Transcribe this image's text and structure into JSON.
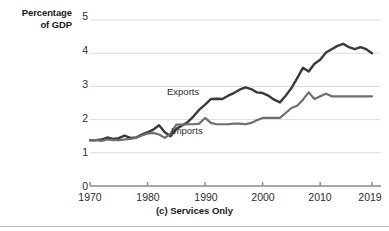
{
  "figure": {
    "caption": "(c) Services Only",
    "y_axis_title_line1": "Percentage",
    "y_axis_title_line2": "of GDP"
  },
  "colors": {
    "exports_line": "#3a3a3a",
    "imports_line": "#6e6e6e",
    "gridline": "#dcdcdc",
    "axis": "#8a8a8a",
    "text": "#2b2b2b"
  },
  "chart_data": {
    "type": "line",
    "title": "(c) Services Only",
    "xlabel": "",
    "ylabel": "Percentage of GDP",
    "xlim": [
      1970,
      2019
    ],
    "ylim": [
      0,
      5
    ],
    "yticks": [
      0,
      1,
      2,
      3,
      4,
      5
    ],
    "ytick_labels": [
      "0",
      "1",
      "2",
      "3",
      "4",
      "5"
    ],
    "xticks": [
      1970,
      1980,
      1990,
      2000,
      2010,
      2019
    ],
    "xtick_labels": [
      "1970",
      "1980",
      "1990",
      "2000",
      "2010",
      "2019"
    ],
    "grid": "horizontal",
    "legend": "inline-labels",
    "x": [
      1970,
      1971,
      1972,
      1973,
      1974,
      1975,
      1976,
      1977,
      1978,
      1979,
      1980,
      1981,
      1982,
      1983,
      1984,
      1985,
      1986,
      1987,
      1988,
      1989,
      1990,
      1991,
      1992,
      1993,
      1994,
      1995,
      1996,
      1997,
      1998,
      1999,
      2000,
      2001,
      2002,
      2003,
      2004,
      2005,
      2006,
      2007,
      2008,
      2009,
      2010,
      2011,
      2012,
      2013,
      2014,
      2015,
      2016,
      2017,
      2018,
      2019
    ],
    "series": [
      {
        "name": "Exports",
        "color": "#3a3a3a",
        "values": [
          1.38,
          1.38,
          1.4,
          1.46,
          1.42,
          1.44,
          1.52,
          1.45,
          1.46,
          1.55,
          1.62,
          1.7,
          1.83,
          1.62,
          1.5,
          1.72,
          1.82,
          1.93,
          2.1,
          2.3,
          2.45,
          2.62,
          2.63,
          2.62,
          2.72,
          2.8,
          2.9,
          2.97,
          2.92,
          2.82,
          2.8,
          2.72,
          2.6,
          2.52,
          2.72,
          2.95,
          3.25,
          3.56,
          3.45,
          3.68,
          3.8,
          4.02,
          4.12,
          4.22,
          4.28,
          4.18,
          4.12,
          4.18,
          4.12,
          4.0
        ]
      },
      {
        "name": "Imports",
        "color": "#6e6e6e",
        "values": [
          1.38,
          1.38,
          1.36,
          1.4,
          1.38,
          1.38,
          1.4,
          1.42,
          1.45,
          1.52,
          1.58,
          1.6,
          1.55,
          1.45,
          1.58,
          1.85,
          1.85,
          1.86,
          1.86,
          1.88,
          2.05,
          1.9,
          1.86,
          1.86,
          1.86,
          1.88,
          1.88,
          1.86,
          1.9,
          1.98,
          2.05,
          2.05,
          2.05,
          2.05,
          2.2,
          2.35,
          2.42,
          2.6,
          2.82,
          2.62,
          2.7,
          2.78,
          2.7,
          2.7,
          2.7,
          2.7,
          2.7,
          2.7,
          2.7,
          2.7
        ]
      }
    ]
  }
}
